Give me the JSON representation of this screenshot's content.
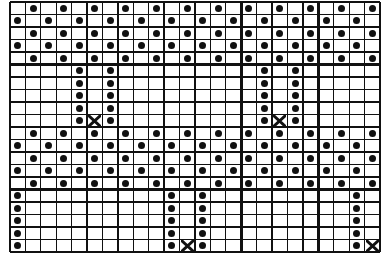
{
  "chart_type": "knitting-stitch-chart",
  "grid": {
    "columns": 24,
    "rows": 20,
    "major_every_cols": 5,
    "major_every_rows": 5,
    "line_color": "#111111",
    "background": "#ffffff"
  },
  "legend_symbols": {
    "dot": "filled-dot-stitch",
    "x": "cross-stitch"
  },
  "blocks": [
    {
      "name": "checker-band-top",
      "rows": [
        0,
        1,
        2,
        3,
        4
      ],
      "pattern": "checker",
      "even_row_cols": "odd",
      "odd_row_cols": "even"
    },
    {
      "name": "column-band-1",
      "rows": [
        5,
        6,
        7,
        8,
        9
      ],
      "dot_columns": [
        4,
        6,
        16,
        18
      ],
      "x_marks": [
        {
          "row": 9,
          "col": 5
        },
        {
          "row": 9,
          "col": 17
        }
      ]
    },
    {
      "name": "checker-band-middle",
      "rows": [
        10,
        11,
        12,
        13,
        14
      ],
      "pattern": "checker",
      "even_row_cols": "odd",
      "odd_row_cols": "even"
    },
    {
      "name": "column-band-2",
      "rows": [
        15,
        16,
        17,
        18,
        19
      ],
      "dot_columns": [
        0,
        10,
        12,
        22
      ],
      "x_marks": [
        {
          "row": 19,
          "col": 11
        },
        {
          "row": 19,
          "col": 23
        }
      ]
    }
  ]
}
